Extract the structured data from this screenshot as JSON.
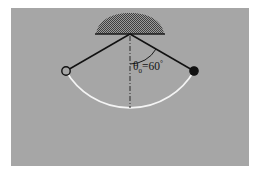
{
  "figure": {
    "background_color": "#ffffff",
    "panel_color": "#a6a6a6",
    "panel": {
      "x": 11,
      "y": 8,
      "width": 238,
      "height": 158
    },
    "ink_color": "#1a1a1a",
    "trajectory_color": "#f2f2f2",
    "hatch_color": "#4d4d4d"
  },
  "labels": {
    "angle_symbol": "θ",
    "angle_subscript": "0",
    "angle_equals": "=",
    "angle_value": "60",
    "angle_degree_symbol": "°",
    "angle_full_text": "θ₀=60°"
  },
  "geometry": {
    "pivot": {
      "x": 130,
      "y": 34
    },
    "arm_length": 74,
    "amplitude_degrees": 60,
    "left_bob": {
      "x": 66,
      "y": 71,
      "style": "open"
    },
    "right_bob": {
      "x": 194,
      "y": 71,
      "style": "filled"
    },
    "vertical_reference_end": {
      "x": 130,
      "y": 108
    },
    "angle_arc_radius": 30,
    "swing_arc_lowest_y": 108
  },
  "elements": {
    "support_name": "ceiling support",
    "left_arm_name": "pendulum string left",
    "right_arm_name": "pendulum string right",
    "open_bob_name": "bob start position",
    "filled_bob_name": "bob end position",
    "trajectory_name": "swing trajectory arc"
  }
}
